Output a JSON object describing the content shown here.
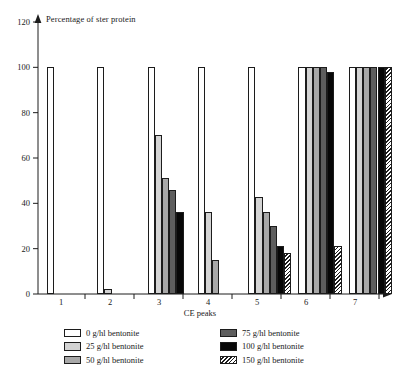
{
  "chart_data": {
    "type": "bar",
    "title": "Percentage of ster protein",
    "xlabel": "CE peaks",
    "ylabel": "Percentage of ster protein",
    "categories": [
      "1",
      "2",
      "3",
      "4",
      "5",
      "6",
      "7"
    ],
    "ylim": [
      0,
      120
    ],
    "yticks": [
      0,
      20,
      40,
      60,
      80,
      100,
      120
    ],
    "ytick_labels": [
      "0",
      "20",
      "40",
      "60",
      "80",
      "100",
      "120"
    ],
    "grid": false,
    "legend_position": "below-plot",
    "series": [
      {
        "name": "0 g/hl bentonite",
        "swatch": "sw-0",
        "color": "#ffffff",
        "values": [
          100,
          100,
          100,
          100,
          100,
          100,
          100
        ]
      },
      {
        "name": "25 g/hl bentonite",
        "swatch": "sw-25",
        "color": "#d3d3d3",
        "values": [
          null,
          2,
          70,
          36,
          43,
          100,
          100
        ]
      },
      {
        "name": "50 g/hl bentonite",
        "swatch": "sw-50",
        "color": "#a8a8a8",
        "values": [
          null,
          null,
          51,
          15,
          36,
          100,
          100
        ]
      },
      {
        "name": "75 g/hl bentonite",
        "swatch": "sw-75",
        "color": "#5e5e5e",
        "values": [
          null,
          null,
          46,
          null,
          30,
          100,
          100
        ]
      },
      {
        "name": "100 g/hl bentonite",
        "swatch": "sw-100",
        "color": "#080808",
        "values": [
          null,
          null,
          36,
          null,
          21,
          98,
          100
        ]
      },
      {
        "name": "150 g/hl bentonite",
        "swatch": "sw-150",
        "color": "hatch",
        "values": [
          null,
          null,
          null,
          null,
          18,
          21,
          100
        ]
      }
    ]
  },
  "legend": {
    "left_column": [
      "0 g/hl bentonite",
      "25 g/hl bentonite",
      "50 g/hl bentonite"
    ],
    "right_column": [
      "75 g/hl bentonite",
      "100 g/hl bentonite",
      "150 g/hl bentonite"
    ]
  }
}
